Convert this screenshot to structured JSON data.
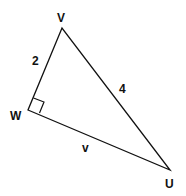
{
  "diagram": {
    "type": "right-triangle",
    "vertices": {
      "V": {
        "label": "V",
        "x": 62,
        "y": 28
      },
      "W": {
        "label": "W",
        "x": 28,
        "y": 110
      },
      "U": {
        "label": "U",
        "x": 170,
        "y": 170
      }
    },
    "sides": {
      "VW": {
        "label": "2"
      },
      "VU": {
        "label": "4"
      },
      "WU": {
        "label": "v"
      }
    },
    "right_angle_at": "W",
    "stroke_color": "#111111"
  }
}
